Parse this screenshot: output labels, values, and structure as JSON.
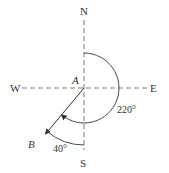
{
  "diagram": {
    "type": "compass-bearing",
    "labels": {
      "north": "N",
      "south": "S",
      "east": "E",
      "west": "W",
      "origin": "A",
      "endpoint": "B",
      "bearing_angle": "220°",
      "offset_angle": "40°"
    },
    "bearing_degrees": 220,
    "offset_degrees": 40,
    "colors": {
      "axis": "#7a7a7a",
      "line": "#333333",
      "text": "#333333"
    }
  }
}
